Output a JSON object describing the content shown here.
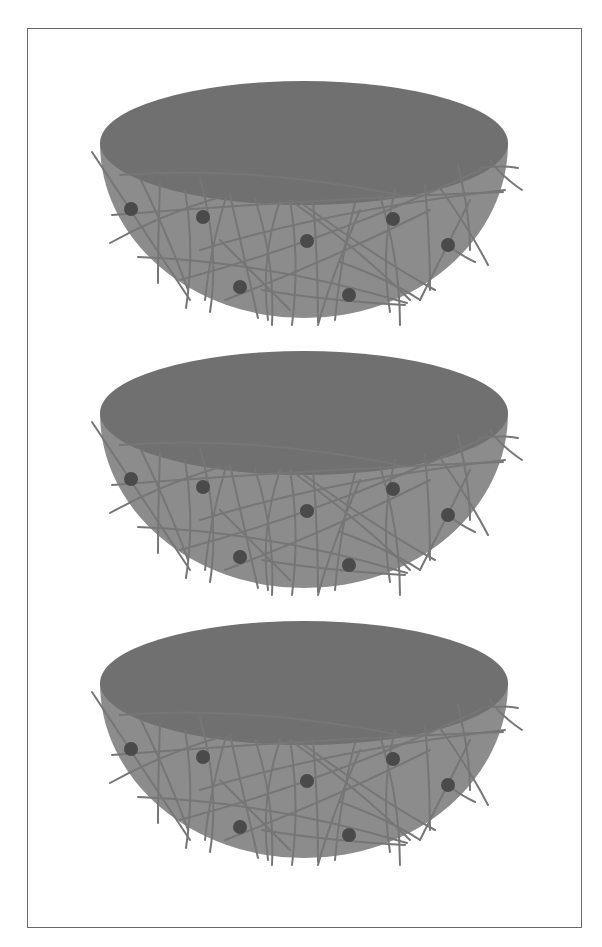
{
  "figure": {
    "panels": [
      {
        "label": "",
        "offset_y": 0
      },
      {
        "label": "",
        "offset_y": 270
      },
      {
        "label": "",
        "offset_y": 540
      }
    ],
    "colors": {
      "frame": "#6a6a6a",
      "top_face": "#707070",
      "shell": "#8c8c8c",
      "fiber": "#767676",
      "particle": "#4a4a4a",
      "background": "#ffffff"
    },
    "particles_per_panel": 7
  }
}
